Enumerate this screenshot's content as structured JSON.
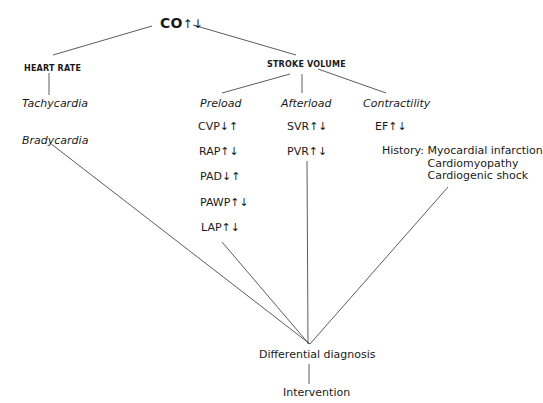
{
  "root": {
    "label": "CO",
    "arrows": "↑↓"
  },
  "heart_rate": {
    "title": "HEART RATE",
    "items": [
      "Tachycardia",
      "Bradycardia"
    ]
  },
  "stroke_volume": {
    "title": "STROKE VOLUME",
    "preload": {
      "title": "Preload",
      "params": [
        "CVP↓↑",
        "RAP↑↓",
        "PAD↓↑",
        "PAWP↑↓",
        "LAP↑↓"
      ]
    },
    "afterload": {
      "title": "Afterload",
      "params": [
        "SVR↑↓",
        "PVR↑↓"
      ]
    },
    "contractility": {
      "title": "Contractility",
      "params": [
        "EF↑↓"
      ],
      "history_label": "History:",
      "history_items": [
        "Myocardial infarction",
        "Cardiomyopathy",
        "Cardiogenic shock"
      ]
    }
  },
  "outcome": {
    "diagnosis": "Differential diagnosis",
    "intervention": "Intervention"
  }
}
